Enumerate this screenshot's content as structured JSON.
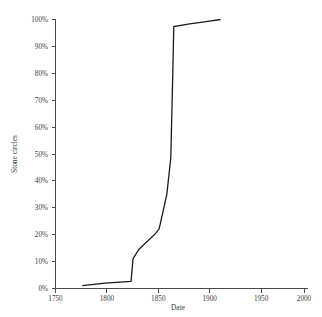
{
  "chart_data": {
    "type": "line",
    "title": "",
    "xlabel": "Date",
    "ylabel": "Stone circles",
    "xlim": [
      1750,
      2000
    ],
    "ylim": [
      0,
      100
    ],
    "grid": false,
    "legend": "none",
    "x_ticks": [
      "1750",
      "1800",
      "1850",
      "1900",
      "1950",
      "2000"
    ],
    "x_tick_values": [
      1750,
      1800,
      1850,
      1900,
      1950,
      2000
    ],
    "y_ticks": [
      "0%",
      "10%",
      "20%",
      "30%",
      "40%",
      "50%",
      "60%",
      "70%",
      "80%",
      "90%",
      "100%"
    ],
    "y_tick_values": [
      0,
      10,
      20,
      30,
      40,
      50,
      60,
      70,
      80,
      90,
      100
    ],
    "series": [
      {
        "name": "Stone circles",
        "color": "#1a1a1a",
        "x": [
          1777,
          1800,
          1826,
          1828,
          1834,
          1850,
          1854,
          1855,
          1862,
          1866,
          1868,
          1869,
          1885,
          1905,
          1916
        ],
        "y": [
          1.1,
          2.0,
          2.6,
          11.1,
          14.6,
          20.2,
          22.0,
          23.4,
          35.0,
          48.6,
          80.0,
          97.4,
          98.4,
          99.4,
          100.0
        ]
      }
    ]
  }
}
